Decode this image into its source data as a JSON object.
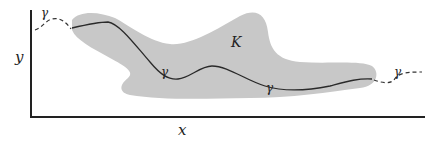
{
  "figure": {
    "axes": {
      "x_label": "x",
      "y_label": "y"
    },
    "region": {
      "label": "K",
      "fill_color": "#c8c8c8"
    },
    "curve": {
      "label": "γ",
      "labels": [
        "γ",
        "γ",
        "γ",
        "γ"
      ],
      "stroke_color": "#2a2a2a",
      "dashed_outside_region": true
    },
    "colors": {
      "axis": "#222222",
      "background": "#ffffff"
    }
  }
}
